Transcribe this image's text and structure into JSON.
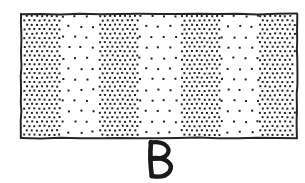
{
  "figure": {
    "label": "B",
    "label_position": "below-rectangle",
    "background_color": "#ffffff",
    "ink_color": "#1a1a1a",
    "style": "hand-drawn line art, stippled fill"
  },
  "rectangle": {
    "x": 21,
    "y": 14,
    "width": 276,
    "height": 124,
    "stroke_color": "#262626",
    "stroke_width": 2,
    "fill_color": "#ffffff"
  },
  "chart_data": {
    "type": "bar",
    "title": "B",
    "subtitle": "Alternating dot-density bands in a rectangle",
    "xlabel": "",
    "ylabel": "",
    "categories": [
      "band-1",
      "band-2",
      "band-3",
      "band-4",
      "band-5",
      "band-6",
      "band-7"
    ],
    "values": [
      100,
      18,
      100,
      18,
      100,
      18,
      100
    ],
    "value_meaning": "relative dot density (percent of maximum stipple density)",
    "grid": false,
    "legend": false,
    "bands": [
      {
        "index": 1,
        "density": "dense",
        "x_start": 21,
        "x_end": 62,
        "dot_pitch": 5,
        "dot_size": 2
      },
      {
        "index": 2,
        "density": "sparse",
        "x_start": 62,
        "x_end": 99,
        "dot_pitch": 12,
        "dot_size": 2
      },
      {
        "index": 3,
        "density": "dense",
        "x_start": 99,
        "x_end": 139,
        "dot_pitch": 5,
        "dot_size": 2
      },
      {
        "index": 4,
        "density": "sparse",
        "x_start": 139,
        "x_end": 181,
        "dot_pitch": 12,
        "dot_size": 2
      },
      {
        "index": 5,
        "density": "dense",
        "x_start": 181,
        "x_end": 221,
        "dot_pitch": 5,
        "dot_size": 2
      },
      {
        "index": 6,
        "density": "sparse",
        "x_start": 221,
        "x_end": 259,
        "dot_pitch": 12,
        "dot_size": 2
      },
      {
        "index": 7,
        "density": "dense",
        "x_start": 259,
        "x_end": 297,
        "dot_pitch": 5,
        "dot_size": 2
      }
    ],
    "dot_color": "#222222",
    "band_count": 7,
    "dense_band_count": 4,
    "sparse_band_count": 3
  },
  "label": {
    "text": "B",
    "x": 159,
    "y": 176,
    "font_size": 40,
    "color": "#1a1a1a"
  }
}
